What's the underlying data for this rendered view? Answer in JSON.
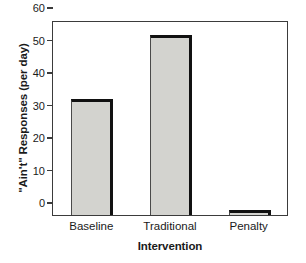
{
  "chart_data": {
    "type": "bar",
    "title": "",
    "categories": [
      "Baseline",
      "Traditional",
      "Penalty"
    ],
    "values": [
      35.6,
      55.5,
      1.5
    ],
    "series": [
      {
        "name": "\"Ain't\" Responses (per day)",
        "values": [
          35.6,
          55.5,
          1.5
        ]
      }
    ],
    "xlabel": "Intervention",
    "ylabel": "\"Ain't\" Responses (per day)",
    "ylim": [
      0,
      60
    ],
    "yticks": [
      0,
      10,
      20,
      30,
      40,
      50,
      60
    ],
    "ytick_labels": [
      "0",
      "10",
      "20",
      "30",
      "40",
      "50",
      "60"
    ],
    "grid": false,
    "legend": false,
    "legend_position": "none",
    "bar_fill_color": "#d3d3cf",
    "bar_edge_color": "#111111",
    "axis_color": "#3b3b3b",
    "background_color": "#ffffff"
  }
}
